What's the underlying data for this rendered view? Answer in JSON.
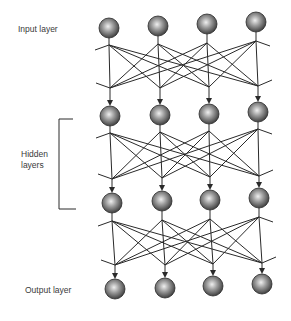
{
  "diagram": {
    "type": "feedforward-neural-network",
    "labels": {
      "input": "Input layer",
      "hidden": "Hidden\nlayers",
      "output": "Output layer"
    },
    "colors": {
      "line": "#2a2a2a",
      "node_dark": "#3c3c3c",
      "node_mid": "#8a8a8a",
      "node_light": "#e6e6e6",
      "text": "#3a3a3a"
    },
    "layers": [
      {
        "name": "input-layer",
        "nodes": [
          [
            109,
            28
          ],
          [
            158,
            26
          ],
          [
            207,
            24
          ],
          [
            256,
            22
          ]
        ]
      },
      {
        "name": "hidden-layer-1",
        "nodes": [
          [
            110,
            116
          ],
          [
            160,
            115
          ],
          [
            209,
            114
          ],
          [
            258,
            112
          ]
        ]
      },
      {
        "name": "hidden-layer-2",
        "nodes": [
          [
            112,
            203
          ],
          [
            162,
            201
          ],
          [
            210,
            200
          ],
          [
            259,
            198
          ]
        ]
      },
      {
        "name": "output-layer",
        "nodes": [
          [
            115,
            289
          ],
          [
            165,
            288
          ],
          [
            213,
            286
          ],
          [
            262,
            284
          ]
        ]
      }
    ],
    "node_radius": 10,
    "connections": [
      {
        "from": "input-layer",
        "to": "hidden-layer-1",
        "fan_y": [
          45,
          44,
          43,
          41
        ],
        "merge_y": [
          88,
          88,
          87,
          86
        ]
      },
      {
        "from": "hidden-layer-1",
        "to": "hidden-layer-2",
        "fan_y": [
          133,
          132,
          131,
          129
        ],
        "merge_y": [
          179,
          178,
          177,
          176
        ]
      },
      {
        "from": "hidden-layer-2",
        "to": "output-layer",
        "fan_y": [
          221,
          220,
          219,
          217
        ],
        "merge_y": [
          265,
          265,
          264,
          263
        ]
      }
    ],
    "bracket": {
      "x": 59,
      "top": 119,
      "bottom": 209,
      "top_tick_x": 73,
      "bottom_tick_x": 76
    }
  }
}
